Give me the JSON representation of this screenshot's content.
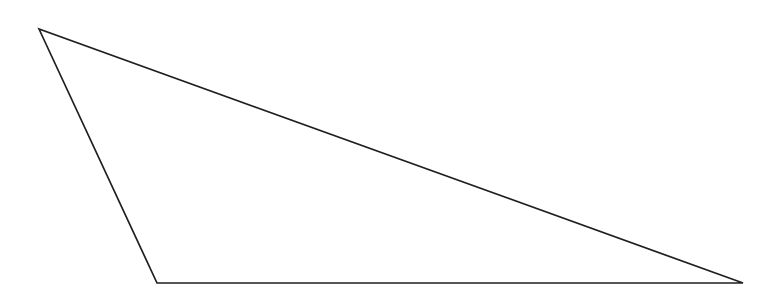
{
  "figure": {
    "shape": "triangle",
    "vertices": [
      {
        "name": "apex-top-left",
        "x": 39,
        "y": 29
      },
      {
        "name": "bottom-left",
        "x": 157,
        "y": 283
      },
      {
        "name": "bottom-right",
        "x": 743,
        "y": 283
      }
    ],
    "stroke_color": "#1f1f1f",
    "stroke_width": 1.7,
    "fill_color": "none",
    "background_color": "#ffffff",
    "canvas_width": 782,
    "canvas_height": 302
  }
}
